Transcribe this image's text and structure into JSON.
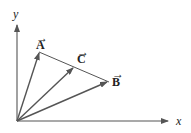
{
  "diagram": {
    "type": "vector-diagram",
    "origin": [
      17,
      121
    ],
    "axes": {
      "x_label": "x",
      "y_label": "y"
    },
    "vectors": [
      {
        "name": "A",
        "label": "A",
        "arrow": "→",
        "tip": [
          39,
          53
        ]
      },
      {
        "name": "C",
        "label": "C",
        "arrow": "→",
        "tip": [
          73,
          68
        ]
      },
      {
        "name": "B",
        "label": "B",
        "arrow": "→",
        "tip": [
          107,
          82
        ]
      }
    ],
    "connector": {
      "from": "A",
      "to": "B"
    },
    "colors": {
      "vector": "#555555",
      "axis": "#555555",
      "connector": "#555555"
    }
  }
}
